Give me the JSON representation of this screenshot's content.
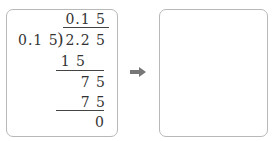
{
  "left_panel": {
    "quotient": "0.1 5",
    "divisor": "0.1 5",
    "dividend": "2.2 5",
    "steps": [
      {
        "value": "1 5",
        "role": "subtract"
      },
      {
        "value": "7 5",
        "role": "remainder"
      },
      {
        "value": "7 5",
        "role": "subtract"
      },
      {
        "value": "0",
        "role": "remainder"
      }
    ]
  },
  "arrow": {
    "icon": "right-arrow-icon",
    "color": "#777777"
  },
  "right_panel": {
    "content": ""
  },
  "colors": {
    "border": "#b8b8b8",
    "text": "#333333"
  }
}
